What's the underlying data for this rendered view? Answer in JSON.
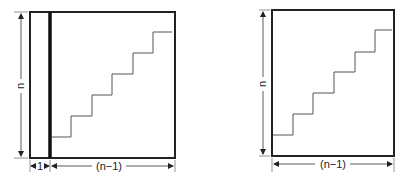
{
  "figures": [
    {
      "id": "left",
      "height_label": "n",
      "width_labels": [
        "1",
        "(n−1)"
      ],
      "colors": {
        "stroke": "#222222",
        "stair": "#555555"
      }
    },
    {
      "id": "right",
      "height_label": "n",
      "width_labels": [
        "(n−1)"
      ],
      "colors": {
        "stroke": "#222222",
        "stair": "#555555"
      }
    }
  ]
}
